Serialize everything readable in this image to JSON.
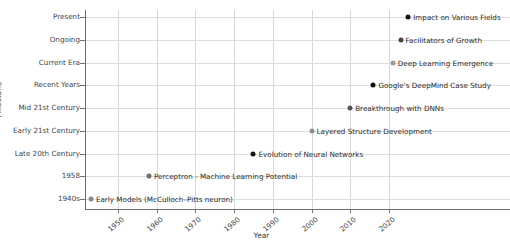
{
  "chart_data": {
    "type": "scatter",
    "title": "",
    "xlabel": "Year",
    "ylabel": "Milestone",
    "xlim": [
      1940,
      2030
    ],
    "xticks": [
      1950,
      1960,
      1970,
      1980,
      1990,
      2000,
      2010,
      2020
    ],
    "xtick_labels": [
      "1950",
      "1960",
      "1970",
      "1980",
      "1990",
      "2000",
      "2010",
      "2020"
    ],
    "ytick_labels": [
      "Present",
      "Ongoing",
      "Current Era",
      "Recent Years",
      "Mid 21st Century",
      "Early 21st Century",
      "Late 20th Century",
      "1958",
      "1940s"
    ],
    "grid": true,
    "legend": "none",
    "points": [
      {
        "label": "Early Models (McCulloch–Pitts neuron)",
        "x": 1943,
        "y_category": "1940s",
        "color": "#8a8a8a"
      },
      {
        "label": "Perceptron - Machine Learning Potential",
        "x": 1958,
        "y_category": "1958",
        "color": "#6e6e6e"
      },
      {
        "label": "Evolution of Neural Networks",
        "x": 1985,
        "y_category": "Late 20th Century",
        "color": "#141414"
      },
      {
        "label": "Layered Structure Development",
        "x": 2000,
        "y_category": "Early 21st Century",
        "color": "#8f8f8f"
      },
      {
        "label": "Breakthrough with DNNs",
        "x": 2010,
        "y_category": "Mid 21st Century",
        "color": "#555555"
      },
      {
        "label": "Google's DeepMind Case Study",
        "x": 2016,
        "y_category": "Recent Years",
        "color": "#141414"
      },
      {
        "label": "Deep Learning Emergence",
        "x": 2021,
        "y_category": "Current Era",
        "color": "#9a9a9a"
      },
      {
        "label": "Facilitators of Growth",
        "x": 2023,
        "y_category": "Ongoing",
        "color": "#474747"
      },
      {
        "label": "Impact on Various Fields",
        "x": 2025,
        "y_category": "Present",
        "color": "#141414"
      }
    ]
  },
  "axes": {
    "y_title": "Milestone",
    "x_title": "Year"
  }
}
